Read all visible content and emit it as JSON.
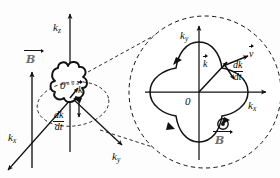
{
  "figure": {
    "background": "#fdfdfd",
    "width": 280,
    "height": 178,
    "ink_color": "#111111",
    "field_label_color": "#6f6f6f"
  },
  "left_panel": {
    "name": "three-dimensional k-space view",
    "axes": [
      {
        "id": "kz",
        "symbol": "k",
        "subscript": "z",
        "direction": "up"
      },
      {
        "id": "kx",
        "symbol": "k",
        "subscript": "x",
        "direction": "down-left"
      },
      {
        "id": "ky",
        "symbol": "k",
        "subscript": "y",
        "direction": "down-right"
      }
    ],
    "origin_label": "0",
    "wavevector_label": "k",
    "field_label": "B",
    "field_direction": "up",
    "rate_numerator": "dk",
    "rate_denominator": "dt",
    "surface_shape": "four-lobed fermi surface cross section",
    "orbit_plane": "dashed ellipse"
  },
  "right_panel": {
    "name": "magnified orbit in the kx-ky plane",
    "axes": [
      {
        "id": "kx",
        "symbol": "k",
        "subscript": "x",
        "direction": "right"
      },
      {
        "id": "ky",
        "symbol": "k",
        "subscript": "y",
        "direction": "up"
      }
    ],
    "origin_label": "0",
    "wavevector_label": "k",
    "velocity_label": "v",
    "rate_numerator": "dk",
    "rate_denominator": "dt",
    "field_label": "B",
    "field_direction_symbol": "out-of-page",
    "orbit_shape": "cloverleaf closed orbit",
    "orbit_sense": "counter-clockwise",
    "boundary": "dashed magnifier circle"
  },
  "connectors": {
    "name": "magnification cone",
    "style": "dashed"
  }
}
